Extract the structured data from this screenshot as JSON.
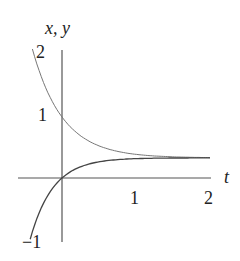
{
  "chart_data": {
    "type": "line",
    "title": "",
    "xlabel": "t",
    "ylabel": "x, y",
    "xlim": [
      -0.45,
      2.0
    ],
    "ylim": [
      -1.05,
      2.1
    ],
    "x_ticks": [
      "1",
      "2"
    ],
    "y_ticks": [
      "2",
      "1",
      "-1"
    ],
    "grid": false,
    "legend": null,
    "asymptote": 0.33,
    "series": [
      {
        "name": "x(t)",
        "description": "decaying curve from 2 down toward asymptote",
        "x": [
          -0.4,
          -0.2,
          0,
          0.25,
          0.5,
          0.75,
          1.0,
          1.5,
          2.0
        ],
        "values": [
          2.0,
          1.43,
          1.0,
          0.72,
          0.55,
          0.45,
          0.4,
          0.35,
          0.34
        ]
      },
      {
        "name": "y(t)",
        "description": "rising curve from -1 up toward asymptote",
        "x": [
          -0.43,
          -0.3,
          -0.15,
          0,
          0.25,
          0.5,
          0.75,
          1.0,
          1.5,
          2.0
        ],
        "values": [
          -1.0,
          -0.55,
          -0.2,
          0.0,
          0.18,
          0.26,
          0.3,
          0.32,
          0.33,
          0.33
        ]
      }
    ]
  },
  "labels": {
    "axis_y": "x, y",
    "axis_x": "t",
    "tick_y_2": "2",
    "tick_y_1": "1",
    "tick_y_neg1": "−1",
    "tick_x_1": "1",
    "tick_x_2": "2"
  }
}
